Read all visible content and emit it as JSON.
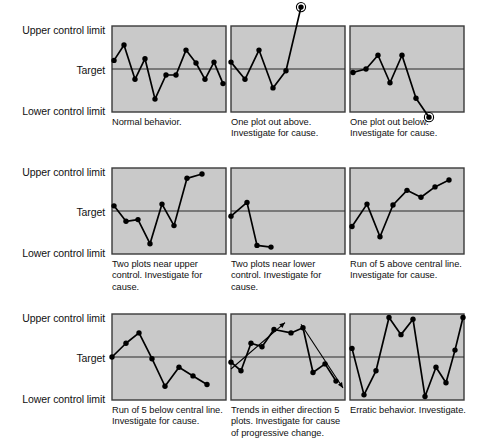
{
  "figure": {
    "axis_labels": {
      "upper": "Upper control limit",
      "target": "Target",
      "lower": "Lower control limit"
    },
    "colors": {
      "plot_fill": "#c9c9c9",
      "plot_border": "#3a3a3a",
      "center_line": "#2b2b2b",
      "series_line": "#000000",
      "marker": "#000000",
      "text": "#111111",
      "background": "#ffffff"
    },
    "panel_geometry": {
      "width": 114,
      "height": 86,
      "ucl_y": 0,
      "target_y": 41,
      "lcl_y": 86
    }
  },
  "chart_data": [
    {
      "id": "panel-1",
      "type": "line",
      "title": "Normal behavior.",
      "caption": "Normal behavior.",
      "xlabel": "",
      "ylabel": "",
      "ylim": [
        0,
        100
      ],
      "grid": false,
      "legend": "none",
      "center_line": 50,
      "points": [
        {
          "x": 2,
          "y": 60
        },
        {
          "x": 12,
          "y": 78
        },
        {
          "x": 23,
          "y": 38
        },
        {
          "x": 33,
          "y": 62
        },
        {
          "x": 43,
          "y": 15
        },
        {
          "x": 54,
          "y": 43
        },
        {
          "x": 64,
          "y": 43
        },
        {
          "x": 74,
          "y": 72
        },
        {
          "x": 84,
          "y": 57
        },
        {
          "x": 93,
          "y": 38
        },
        {
          "x": 102,
          "y": 58
        },
        {
          "x": 111,
          "y": 33
        }
      ],
      "out_of_control": []
    },
    {
      "id": "panel-2",
      "type": "line",
      "title": "One plot out above.",
      "caption": "One plot out above. Investigate for cause.",
      "xlabel": "",
      "ylabel": "",
      "ylim": [
        0,
        100
      ],
      "grid": false,
      "legend": "none",
      "center_line": 50,
      "points": [
        {
          "x": 0,
          "y": 58
        },
        {
          "x": 14,
          "y": 38
        },
        {
          "x": 28,
          "y": 72
        },
        {
          "x": 42,
          "y": 28
        },
        {
          "x": 55,
          "y": 48
        },
        {
          "x": 70,
          "y": 122
        }
      ],
      "out_of_control": [
        5
      ]
    },
    {
      "id": "panel-3",
      "type": "line",
      "title": "One plot out below.",
      "caption": "One plot out below. Investigate for cause.",
      "xlabel": "",
      "ylabel": "",
      "ylim": [
        0,
        100
      ],
      "grid": false,
      "legend": "none",
      "center_line": 50,
      "points": [
        {
          "x": 3,
          "y": 46
        },
        {
          "x": 16,
          "y": 50
        },
        {
          "x": 28,
          "y": 66
        },
        {
          "x": 40,
          "y": 34
        },
        {
          "x": 52,
          "y": 66
        },
        {
          "x": 66,
          "y": 16
        },
        {
          "x": 79,
          "y": -6
        }
      ],
      "out_of_control": [
        6
      ]
    },
    {
      "id": "panel-4",
      "type": "line",
      "title": "Two plots near upper control.",
      "caption": "Two plots near upper control. Investigate for cause.",
      "xlabel": "",
      "ylabel": "",
      "ylim": [
        0,
        100
      ],
      "grid": false,
      "legend": "none",
      "center_line": 50,
      "points": [
        {
          "x": 2,
          "y": 56
        },
        {
          "x": 14,
          "y": 38
        },
        {
          "x": 26,
          "y": 40
        },
        {
          "x": 38,
          "y": 12
        },
        {
          "x": 50,
          "y": 58
        },
        {
          "x": 62,
          "y": 33
        },
        {
          "x": 75,
          "y": 88
        },
        {
          "x": 90,
          "y": 93
        }
      ],
      "out_of_control": []
    },
    {
      "id": "panel-5",
      "type": "line",
      "title": "Two plots near lower control.",
      "caption": "Two plots near lower control. Investigate for cause.",
      "xlabel": "",
      "ylabel": "",
      "ylim": [
        0,
        100
      ],
      "grid": false,
      "legend": "none",
      "center_line": 50,
      "points": [
        {
          "x": 0,
          "y": 44
        },
        {
          "x": 16,
          "y": 60
        },
        {
          "x": 26,
          "y": 10
        },
        {
          "x": 40,
          "y": 8
        }
      ],
      "out_of_control": []
    },
    {
      "id": "panel-6",
      "type": "line",
      "title": "Run of 5 above central line.",
      "caption": "Run of 5 above central line. Investigate for cause.",
      "xlabel": "",
      "ylabel": "",
      "ylim": [
        0,
        100
      ],
      "grid": false,
      "legend": "none",
      "center_line": 50,
      "points": [
        {
          "x": 2,
          "y": 32
        },
        {
          "x": 17,
          "y": 58
        },
        {
          "x": 30,
          "y": 20
        },
        {
          "x": 43,
          "y": 57
        },
        {
          "x": 57,
          "y": 74
        },
        {
          "x": 71,
          "y": 66
        },
        {
          "x": 85,
          "y": 78
        },
        {
          "x": 99,
          "y": 86
        }
      ],
      "out_of_control": []
    },
    {
      "id": "panel-7",
      "type": "line",
      "title": "Run of 5 below central line.",
      "caption": "Run of 5 below central line. Investigate for cause.",
      "xlabel": "",
      "ylabel": "",
      "ylim": [
        0,
        100
      ],
      "grid": false,
      "legend": "none",
      "center_line": 50,
      "points": [
        {
          "x": 0,
          "y": 50
        },
        {
          "x": 14,
          "y": 66
        },
        {
          "x": 27,
          "y": 78
        },
        {
          "x": 40,
          "y": 48
        },
        {
          "x": 53,
          "y": 16
        },
        {
          "x": 67,
          "y": 38
        },
        {
          "x": 81,
          "y": 28
        },
        {
          "x": 95,
          "y": 18
        }
      ],
      "out_of_control": []
    },
    {
      "id": "panel-8",
      "type": "line",
      "title": "Trends in either direction 5 plots.",
      "caption": "Trends in either direction 5 plots. Investigate for cause of progressive change.",
      "xlabel": "",
      "ylabel": "",
      "ylim": [
        0,
        100
      ],
      "grid": false,
      "legend": "none",
      "center_line": 50,
      "points": [
        {
          "x": 0,
          "y": 44
        },
        {
          "x": 10,
          "y": 34
        },
        {
          "x": 20,
          "y": 66
        },
        {
          "x": 31,
          "y": 62
        },
        {
          "x": 43,
          "y": 82
        },
        {
          "x": 60,
          "y": 78
        },
        {
          "x": 72,
          "y": 84
        },
        {
          "x": 82,
          "y": 32
        },
        {
          "x": 94,
          "y": 42
        },
        {
          "x": 105,
          "y": 22
        }
      ],
      "trend_arrows": [
        {
          "x1": 0,
          "y1": 36,
          "x2": 54,
          "y2": 90
        },
        {
          "x1": 70,
          "y1": 88,
          "x2": 112,
          "y2": 14
        }
      ],
      "out_of_control": []
    },
    {
      "id": "panel-9",
      "type": "line",
      "title": "Erratic behavior.",
      "caption": "Erratic behavior. Investigate.",
      "xlabel": "",
      "ylabel": "",
      "ylim": [
        0,
        100
      ],
      "grid": false,
      "legend": "none",
      "center_line": 50,
      "points": [
        {
          "x": 2,
          "y": 60
        },
        {
          "x": 14,
          "y": 6
        },
        {
          "x": 26,
          "y": 34
        },
        {
          "x": 39,
          "y": 96
        },
        {
          "x": 51,
          "y": 76
        },
        {
          "x": 63,
          "y": 94
        },
        {
          "x": 75,
          "y": 4
        },
        {
          "x": 86,
          "y": 38
        },
        {
          "x": 96,
          "y": 20
        },
        {
          "x": 105,
          "y": 58
        },
        {
          "x": 113,
          "y": 96
        }
      ],
      "out_of_control": []
    }
  ],
  "rows": [
    {
      "panels": [
        "panel-1",
        "panel-2",
        "panel-3"
      ]
    },
    {
      "panels": [
        "panel-4",
        "panel-5",
        "panel-6"
      ]
    },
    {
      "panels": [
        "panel-7",
        "panel-8",
        "panel-9"
      ]
    }
  ],
  "captions": {
    "panel_1": "Normal behavior.",
    "panel_2": "One plot out above. Investigate for cause.",
    "panel_3": "One plot out below. Investigate for cause.",
    "panel_4": "Two plots near upper control. Investigate for cause.",
    "panel_5": "Two plots near lower control. Investigate for cause.",
    "panel_6": "Run of 5 above central line. Investigate for cause.",
    "panel_7": "Run of 5 below central line. Investigate for cause.",
    "panel_8": "Trends in either direction 5 plots. Investigate for cause of progressive change.",
    "panel_9": "Erratic behavior. Investigate."
  }
}
